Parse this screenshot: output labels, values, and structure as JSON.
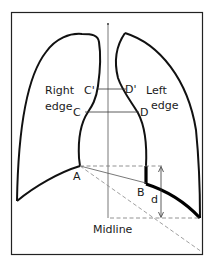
{
  "diagram": {
    "type": "chest radiograph lung outline measurement diagram",
    "labels": {
      "right_edge_line1": "Right",
      "right_edge_line2": "edge",
      "left_edge_line1": "Left",
      "left_edge_line2": "edge",
      "c_prime": "C'",
      "d_prime": "D'",
      "c": "C",
      "d_point": "D",
      "a": "A",
      "b": "B",
      "d_distance": "d",
      "midline": "Midline"
    },
    "colors": {
      "stroke": "#111111",
      "dashed": "#777777",
      "background": "#ffffff"
    }
  }
}
